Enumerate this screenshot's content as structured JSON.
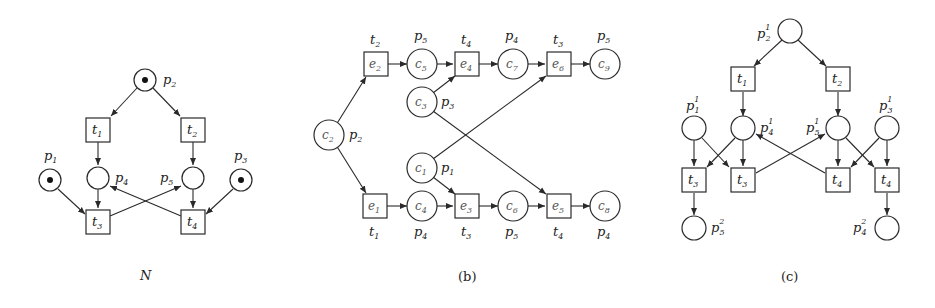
{
  "figure": {
    "panels": [
      {
        "id": "N",
        "caption": "N",
        "places": [
          {
            "id": "p1",
            "label": "p",
            "sub": "1",
            "token": true
          },
          {
            "id": "p2",
            "label": "p",
            "sub": "2",
            "token": true
          },
          {
            "id": "p3",
            "label": "p",
            "sub": "3",
            "token": true
          },
          {
            "id": "p4",
            "label": "p",
            "sub": "4",
            "token": false
          },
          {
            "id": "p5",
            "label": "p",
            "sub": "5",
            "token": false
          }
        ],
        "transitions": [
          {
            "id": "t1",
            "label": "t",
            "sub": "1"
          },
          {
            "id": "t2",
            "label": "t",
            "sub": "2"
          },
          {
            "id": "t3",
            "label": "t",
            "sub": "3"
          },
          {
            "id": "t4",
            "label": "t",
            "sub": "4"
          }
        ],
        "arcs": [
          [
            "p2",
            "t1"
          ],
          [
            "p2",
            "t2"
          ],
          [
            "t1",
            "p4"
          ],
          [
            "t2",
            "p5"
          ],
          [
            "p1",
            "t3"
          ],
          [
            "p4",
            "t3"
          ],
          [
            "t3",
            "p5"
          ],
          [
            "p5",
            "t4"
          ],
          [
            "p3",
            "t4"
          ],
          [
            "t4",
            "p4"
          ]
        ]
      },
      {
        "id": "b",
        "caption": "(b)",
        "conditions": [
          {
            "id": "c1",
            "label": "c",
            "sub": "1",
            "maps_to": {
              "label": "p",
              "sub": "1"
            }
          },
          {
            "id": "c2",
            "label": "c",
            "sub": "2",
            "maps_to": {
              "label": "p",
              "sub": "2"
            }
          },
          {
            "id": "c3",
            "label": "c",
            "sub": "3",
            "maps_to": {
              "label": "p",
              "sub": "3"
            }
          },
          {
            "id": "c4",
            "label": "c",
            "sub": "4",
            "maps_to": {
              "label": "p",
              "sub": "4"
            }
          },
          {
            "id": "c5",
            "label": "c",
            "sub": "5",
            "maps_to": {
              "label": "p",
              "sub": "5"
            }
          },
          {
            "id": "c6",
            "label": "c",
            "sub": "6",
            "maps_to": {
              "label": "p",
              "sub": "5"
            }
          },
          {
            "id": "c7",
            "label": "c",
            "sub": "7",
            "maps_to": {
              "label": "p",
              "sub": "4"
            }
          },
          {
            "id": "c8",
            "label": "c",
            "sub": "8",
            "maps_to": {
              "label": "p",
              "sub": "4"
            }
          },
          {
            "id": "c9",
            "label": "c",
            "sub": "9",
            "maps_to": {
              "label": "p",
              "sub": "5"
            }
          }
        ],
        "events": [
          {
            "id": "e1",
            "label": "e",
            "sub": "1",
            "maps_to": {
              "label": "t",
              "sub": "1"
            }
          },
          {
            "id": "e2",
            "label": "e",
            "sub": "2",
            "maps_to": {
              "label": "t",
              "sub": "2"
            }
          },
          {
            "id": "e3",
            "label": "e",
            "sub": "3",
            "maps_to": {
              "label": "t",
              "sub": "3"
            }
          },
          {
            "id": "e4",
            "label": "e",
            "sub": "4",
            "maps_to": {
              "label": "t",
              "sub": "4"
            }
          },
          {
            "id": "e5",
            "label": "e",
            "sub": "5",
            "maps_to": {
              "label": "t",
              "sub": "4"
            }
          },
          {
            "id": "e6",
            "label": "e",
            "sub": "6",
            "maps_to": {
              "label": "t",
              "sub": "3"
            }
          }
        ],
        "arcs": [
          [
            "c2",
            "e2"
          ],
          [
            "c2",
            "e1"
          ],
          [
            "e2",
            "c5"
          ],
          [
            "c5",
            "e4"
          ],
          [
            "c3",
            "e4"
          ],
          [
            "e4",
            "c7"
          ],
          [
            "c7",
            "e6"
          ],
          [
            "c1",
            "e6"
          ],
          [
            "e6",
            "c9"
          ],
          [
            "e1",
            "c4"
          ],
          [
            "c4",
            "e3"
          ],
          [
            "c1",
            "e3"
          ],
          [
            "e3",
            "c6"
          ],
          [
            "c6",
            "e5"
          ],
          [
            "c3",
            "e5"
          ],
          [
            "e5",
            "c8"
          ]
        ]
      },
      {
        "id": "c",
        "caption": "(c)",
        "places": [
          {
            "id": "p2_1",
            "label": "p",
            "sub": "2",
            "sup": "1"
          },
          {
            "id": "p1_1",
            "label": "p",
            "sub": "1",
            "sup": "1"
          },
          {
            "id": "p4_1",
            "label": "p",
            "sub": "4",
            "sup": "1"
          },
          {
            "id": "p5_1",
            "label": "p",
            "sub": "5",
            "sup": "1"
          },
          {
            "id": "p3_1",
            "label": "p",
            "sub": "3",
            "sup": "1"
          },
          {
            "id": "p5_2",
            "label": "p",
            "sub": "5",
            "sup": "2"
          },
          {
            "id": "p4_2",
            "label": "p",
            "sub": "4",
            "sup": "2"
          }
        ],
        "transitions": [
          {
            "id": "t1",
            "label": "t",
            "sub": "1"
          },
          {
            "id": "t2",
            "label": "t",
            "sub": "2"
          },
          {
            "id": "t3a",
            "label": "t",
            "sub": "3"
          },
          {
            "id": "t3b",
            "label": "t",
            "sub": "3"
          },
          {
            "id": "t4a",
            "label": "t",
            "sub": "4"
          },
          {
            "id": "t4b",
            "label": "t",
            "sub": "4"
          }
        ],
        "arcs": [
          [
            "p2_1",
            "t1"
          ],
          [
            "p2_1",
            "t2"
          ],
          [
            "t1",
            "p4_1"
          ],
          [
            "t2",
            "p5_1"
          ],
          [
            "p1_1",
            "t3a"
          ],
          [
            "p1_1",
            "t3b"
          ],
          [
            "p4_1",
            "t3a"
          ],
          [
            "p4_1",
            "t3b"
          ],
          [
            "t3b",
            "p5_1"
          ],
          [
            "t4a",
            "p4_1"
          ],
          [
            "p5_1",
            "t4a"
          ],
          [
            "p5_1",
            "t4b"
          ],
          [
            "p3_1",
            "t4a"
          ],
          [
            "p3_1",
            "t4b"
          ],
          [
            "t3a",
            "p5_2"
          ],
          [
            "t4b",
            "p4_2"
          ]
        ]
      }
    ]
  }
}
